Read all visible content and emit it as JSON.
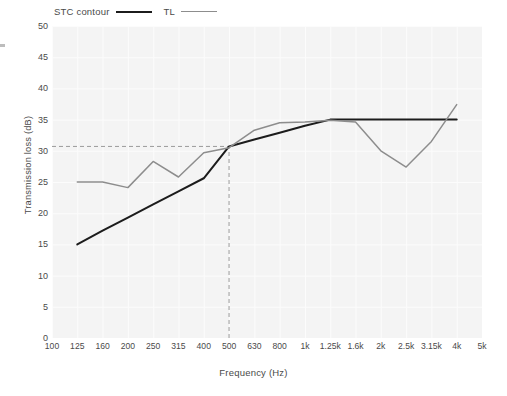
{
  "chart_data": {
    "type": "line",
    "title": "",
    "xlabel": "Frequency  (Hz)",
    "ylabel": "Transmission loss  (dB)",
    "ylim": [
      0,
      50
    ],
    "yticks": [
      0,
      5,
      10,
      15,
      20,
      25,
      30,
      35,
      40,
      45,
      50
    ],
    "ytick_labels": [
      "0",
      "5",
      "10",
      "15",
      "20",
      "25",
      "30",
      "35",
      "40",
      "45",
      "50"
    ],
    "categories": [
      "100",
      "125",
      "160",
      "200",
      "250",
      "315",
      "400",
      "500",
      "630",
      "800",
      "1k",
      "1.25k",
      "1.6k",
      "2k",
      "2.5k",
      "3.15k",
      "4k",
      "5k"
    ],
    "grid": true,
    "legend_position": "above-plot-left",
    "series": [
      {
        "name": "STC contour",
        "color": "#1c1c1c",
        "x": [
          "125",
          "160",
          "200",
          "250",
          "315",
          "400",
          "500",
          "630",
          "800",
          "1k",
          "1.25k",
          "1.6k",
          "2k",
          "2.5k",
          "3.15k",
          "4k"
        ],
        "values": [
          15.0,
          17.2,
          19.3,
          21.4,
          23.5,
          25.6,
          30.7,
          31.8,
          32.9,
          34.0,
          35.0,
          35.0,
          35.0,
          35.0,
          35.0,
          35.0
        ]
      },
      {
        "name": "TL",
        "color": "#8d8d8d",
        "x": [
          "125",
          "160",
          "200",
          "250",
          "315",
          "400",
          "500",
          "630",
          "800",
          "1k",
          "1.25k",
          "1.6k",
          "2k",
          "2.5k",
          "3.15k",
          "4k"
        ],
        "values": [
          25.0,
          25.0,
          24.1,
          28.3,
          25.8,
          29.7,
          30.5,
          33.3,
          34.5,
          34.6,
          34.9,
          34.6,
          30.0,
          27.4,
          31.5,
          37.4
        ]
      }
    ],
    "annotations": [
      {
        "name": "stc-rating-line",
        "type": "hline",
        "y": 30.7,
        "style": "dashed",
        "color": "#9a9a9a"
      },
      {
        "name": "reference-frequency-line",
        "type": "vline",
        "x": "500",
        "y_from": 0,
        "y_to": 30.7,
        "style": "dashed",
        "color": "#9a9a9a"
      }
    ]
  },
  "legend": {
    "items": [
      {
        "label": "STC contour",
        "key": "stc"
      },
      {
        "label": "TL",
        "key": "tl"
      }
    ]
  }
}
